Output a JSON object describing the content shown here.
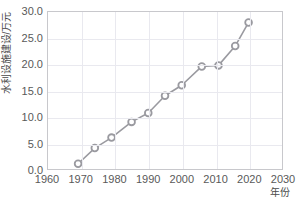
{
  "chart_data": {
    "type": "line",
    "title": "",
    "xlabel": "年份",
    "ylabel": "水利设施建设/万元",
    "xlim": [
      1960,
      2030
    ],
    "ylim": [
      0.0,
      30.0
    ],
    "xticks": [
      "1960",
      "1970",
      "1980",
      "1990",
      "2000",
      "2010",
      "2020",
      "2030"
    ],
    "xtick_values": [
      1960,
      1970,
      1980,
      1990,
      2000,
      2010,
      2020,
      2030
    ],
    "yticks": [
      "0.0",
      "5.0",
      "10.0",
      "15.0",
      "20.0",
      "25.0",
      "30.0"
    ],
    "ytick_values": [
      0.0,
      5.0,
      10.0,
      15.0,
      20.0,
      25.0,
      30.0
    ],
    "grid": true,
    "legend": "none",
    "x": [
      1969,
      1974,
      1979,
      1985,
      1990,
      1995,
      2000,
      2006,
      2011,
      2016,
      2020
    ],
    "values": [
      1.0,
      4.0,
      6.0,
      9.0,
      10.7,
      14.0,
      16.0,
      19.6,
      19.8,
      23.5,
      28.0
    ],
    "series": [
      {
        "name": "水利设施建设",
        "x": [
          1969,
          1974,
          1979,
          1985,
          1990,
          1995,
          2000,
          2006,
          2011,
          2016,
          2020
        ],
        "values": [
          1.0,
          4.0,
          6.0,
          9.0,
          10.7,
          14.0,
          16.0,
          19.6,
          19.8,
          23.5,
          28.0
        ]
      }
    ],
    "marker": "circle",
    "marker_facecolor": "#ffffff",
    "line_color": "#9a9aa0",
    "grid_color": "#e9e9ef",
    "border_color": "#c8c8cc",
    "background_color": "#ffffff",
    "tick_label_color": "#595959"
  }
}
